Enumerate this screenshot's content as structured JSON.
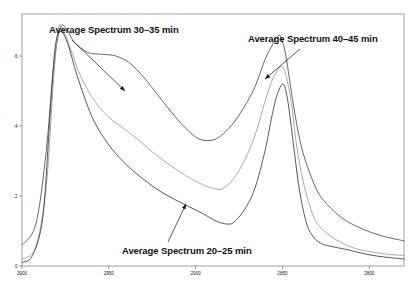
{
  "chart_data": {
    "type": "line",
    "title": "",
    "subtitle": "",
    "xlabel": "",
    "ylabel": "",
    "xlim": [
      3000,
      2780
    ],
    "ylim": [
      0,
      0.72
    ],
    "x_ticks": [
      "3000",
      "2950",
      "2900",
      "2850",
      "2800"
    ],
    "x_tick_values": [
      3000,
      2950,
      2900,
      2850,
      2800
    ],
    "y_ticks": [
      "0",
      ".2",
      ".4",
      ".6"
    ],
    "y_tick_values": [
      0,
      0.2,
      0.4,
      0.6
    ],
    "grid": false,
    "legend_position": "none",
    "axis_direction": "x-reversed",
    "annotations": [
      {
        "id": "anno-3035",
        "label": "Average Spectrum 30–35 min",
        "text_x": 49,
        "text_y": 24,
        "arrow_from_x": 72,
        "arrow_from_y": 40,
        "arrow_to_x": 125,
        "arrow_to_y": 91
      },
      {
        "id": "anno-4045",
        "label": "Average Spectrum 40–45 min",
        "text_x": 248,
        "text_y": 33,
        "arrow_from_x": 300,
        "arrow_from_y": 49,
        "arrow_to_x": 265,
        "arrow_to_y": 79
      },
      {
        "id": "anno-2025",
        "label": "Average Spectrum 20–25 min",
        "text_x": 122,
        "text_y": 245,
        "arrow_from_x": 168,
        "arrow_from_y": 242,
        "arrow_to_x": 186,
        "arrow_to_y": 204
      }
    ],
    "series": [
      {
        "name": "Average Spectrum 40–45 min",
        "color": "#4a4a4a",
        "peak1_wavenumber": 2978,
        "peak1_value": 0.68,
        "peak2_wavenumber": 2850,
        "peak2_value": 0.64,
        "valley_wavenumber": 2888,
        "valley_value": 0.36,
        "left_baseline": 0.06,
        "right_baseline": 0.07,
        "x": [
          3000,
          2992,
          2986,
          2982,
          2978,
          2974,
          2970,
          2962,
          2954,
          2946,
          2938,
          2930,
          2922,
          2914,
          2906,
          2898,
          2890,
          2884,
          2878,
          2872,
          2866,
          2860,
          2856,
          2852,
          2850,
          2848,
          2844,
          2840,
          2836,
          2830,
          2824,
          2816,
          2808,
          2800,
          2792,
          2784,
          2780
        ],
        "y": [
          0.06,
          0.12,
          0.33,
          0.56,
          0.68,
          0.675,
          0.64,
          0.61,
          0.605,
          0.6,
          0.58,
          0.54,
          0.49,
          0.44,
          0.395,
          0.363,
          0.36,
          0.378,
          0.41,
          0.455,
          0.51,
          0.59,
          0.63,
          0.66,
          0.64,
          0.6,
          0.47,
          0.36,
          0.29,
          0.215,
          0.175,
          0.138,
          0.115,
          0.098,
          0.085,
          0.076,
          0.072
        ]
      },
      {
        "name": "Average Spectrum 30–35 min",
        "color": "#9a9a9a",
        "peak1_wavenumber": 2979,
        "peak1_value": 0.68,
        "peak2_wavenumber": 2850,
        "peak2_value": 0.57,
        "valley_wavenumber": 2884,
        "valley_value": 0.22,
        "left_baseline": 0.02,
        "right_baseline": 0.03,
        "x": [
          3000,
          2992,
          2986,
          2982,
          2979,
          2976,
          2972,
          2966,
          2958,
          2950,
          2942,
          2934,
          2926,
          2918,
          2910,
          2902,
          2894,
          2888,
          2884,
          2878,
          2872,
          2866,
          2860,
          2856,
          2852,
          2850,
          2848,
          2845,
          2842,
          2838,
          2832,
          2826,
          2818,
          2808,
          2798,
          2790,
          2780
        ],
        "y": [
          0.02,
          0.055,
          0.23,
          0.52,
          0.68,
          0.67,
          0.62,
          0.54,
          0.47,
          0.425,
          0.395,
          0.365,
          0.33,
          0.3,
          0.272,
          0.248,
          0.228,
          0.22,
          0.222,
          0.25,
          0.3,
          0.37,
          0.47,
          0.53,
          0.565,
          0.57,
          0.545,
          0.47,
          0.35,
          0.24,
          0.14,
          0.1,
          0.072,
          0.05,
          0.04,
          0.034,
          0.03
        ]
      },
      {
        "name": "Average Spectrum 20–25 min",
        "color": "#3a3a3a",
        "peak1_wavenumber": 2980,
        "peak1_value": 0.67,
        "peak2_wavenumber": 2850,
        "peak2_value": 0.52,
        "valley_wavenumber": 2880,
        "valley_value": 0.12,
        "left_baseline": 0.01,
        "right_baseline": 0.02,
        "x": [
          3000,
          2994,
          2988,
          2984,
          2981,
          2978,
          2974,
          2968,
          2960,
          2952,
          2944,
          2936,
          2928,
          2920,
          2912,
          2904,
          2896,
          2888,
          2882,
          2878,
          2872,
          2866,
          2860,
          2856,
          2853,
          2850,
          2848,
          2846,
          2843,
          2840,
          2836,
          2832,
          2828,
          2824,
          2820,
          2812,
          2802,
          2792,
          2780
        ],
        "y": [
          0.01,
          0.03,
          0.14,
          0.42,
          0.62,
          0.67,
          0.64,
          0.54,
          0.43,
          0.36,
          0.31,
          0.272,
          0.24,
          0.212,
          0.19,
          0.17,
          0.15,
          0.128,
          0.12,
          0.125,
          0.16,
          0.22,
          0.33,
          0.43,
          0.49,
          0.52,
          0.5,
          0.44,
          0.32,
          0.21,
          0.12,
          0.082,
          0.065,
          0.058,
          0.054,
          0.046,
          0.034,
          0.026,
          0.02
        ]
      }
    ]
  },
  "frame": {
    "left": 22,
    "top": 14,
    "right": 404,
    "bottom": 266,
    "border_color": "#8a8a8a"
  }
}
